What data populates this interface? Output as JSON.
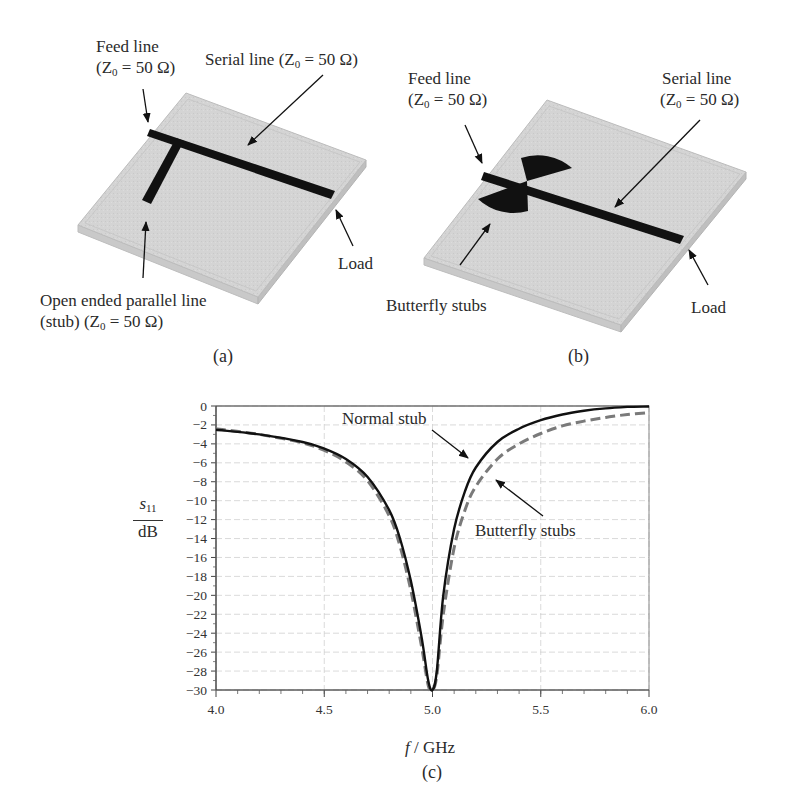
{
  "panel_a": {
    "caption": "(a)",
    "feed_line": {
      "line1": "Feed line",
      "line2": "(Z",
      "sub": "0",
      "line2b": " = 50 Ω)"
    },
    "serial_line": {
      "text": "Serial line (Z",
      "sub": "0",
      "textb": " = 50 Ω)"
    },
    "load": "Load",
    "stub": {
      "line1": "Open ended parallel line",
      "line2": "(stub) (Z",
      "sub": "0",
      "line2b": " = 50 Ω)"
    }
  },
  "panel_b": {
    "caption": "(b)",
    "feed_line": {
      "line1": "Feed line",
      "line2": "(Z",
      "sub": "0",
      "line2b": " = 50 Ω)"
    },
    "serial_line": {
      "line1": "Serial line",
      "line2": "(Z",
      "sub": "0",
      "line2b": " = 50 Ω)"
    },
    "load": "Load",
    "stubs": "Butterfly stubs"
  },
  "panel_c": {
    "caption": "(c)",
    "ylabel_num": "s",
    "ylabel_sub": "11",
    "ylabel_den": "dB",
    "xlabel_f": "f",
    "xlabel_unit": " / GHz",
    "annotation_normal": "Normal stub",
    "annotation_butterfly": "Butterfly stubs"
  },
  "chart_data": {
    "type": "line",
    "title": "",
    "xlabel": "f / GHz",
    "ylabel": "s11 / dB",
    "xlim": [
      4.0,
      6.0
    ],
    "ylim": [
      -30,
      0
    ],
    "x_ticks": [
      "4.0",
      "4.5",
      "5.0",
      "5.5",
      "6.0"
    ],
    "y_ticks": [
      "0",
      "-2",
      "-4",
      "-6",
      "-8",
      "-10",
      "-12",
      "-14",
      "-16",
      "-18",
      "-20",
      "-22",
      "-24",
      "-26",
      "-28",
      "-30"
    ],
    "grid": true,
    "legend_position": "annotations with arrows",
    "x": [
      4.0,
      4.2,
      4.4,
      4.5,
      4.6,
      4.7,
      4.8,
      4.85,
      4.9,
      4.95,
      4.98,
      5.0,
      5.02,
      5.05,
      5.1,
      5.15,
      5.2,
      5.3,
      5.4,
      5.5,
      5.6,
      5.7,
      5.8,
      5.9,
      6.0
    ],
    "series": [
      {
        "name": "Normal stub",
        "style": "solid black",
        "values": [
          -2.5,
          -3.0,
          -3.8,
          -4.5,
          -5.6,
          -7.5,
          -11.0,
          -14.0,
          -18.5,
          -24.5,
          -29.0,
          -30.0,
          -28.0,
          -20.0,
          -13.0,
          -9.0,
          -6.5,
          -3.8,
          -2.4,
          -1.5,
          -0.9,
          -0.5,
          -0.25,
          -0.1,
          -0.05
        ]
      },
      {
        "name": "Butterfly stubs",
        "style": "dashed gray",
        "values": [
          -2.4,
          -3.0,
          -3.9,
          -4.7,
          -5.9,
          -7.9,
          -11.6,
          -14.8,
          -19.5,
          -25.5,
          -29.5,
          -30.0,
          -28.5,
          -22.0,
          -15.0,
          -11.0,
          -8.5,
          -5.6,
          -4.0,
          -2.9,
          -2.1,
          -1.6,
          -1.2,
          -0.9,
          -0.7
        ]
      }
    ]
  }
}
